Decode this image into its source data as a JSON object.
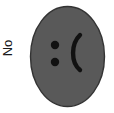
{
  "figure": {
    "width": 114,
    "height": 113,
    "background_color": "#ffffff"
  },
  "axis_label": {
    "text": "No",
    "rotation_degrees": -90,
    "color": "#1a1a1a"
  },
  "face": {
    "name": "sad-face",
    "expression": ":(",
    "shape": "ellipse",
    "fill_color": "#595959",
    "outline_color": "#333333",
    "center_x": 67.5,
    "center_y": 56.5,
    "radius_x": 37.5,
    "radius_y": 50.5,
    "eyes": {
      "color": "#111111",
      "radius": 4.2,
      "upper": {
        "cx": 55,
        "cy": 45
      },
      "lower": {
        "cx": 55,
        "cy": 62
      }
    },
    "mouth": {
      "glyph": "(",
      "color": "#111111",
      "stroke_width": 4.4,
      "top_x": 80,
      "top_y": 35,
      "bottom_x": 80,
      "bottom_y": 70,
      "bulge_x": 71
    }
  }
}
